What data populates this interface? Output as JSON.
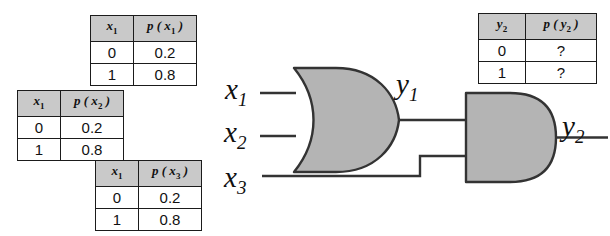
{
  "diagram": {
    "colors": {
      "gate_fill": "#b4b4b4",
      "gate_stroke": "#333333",
      "wire": "#333333",
      "table_header_bg": "#c9c9c9",
      "table_border": "#1b1b1b",
      "text": "#111111"
    }
  },
  "tables": [
    {
      "id": "table-x1",
      "headers": {
        "var": "x",
        "var_sub": "1",
        "prob": "p ( x",
        "prob_sub": "1",
        "prob_close": " )"
      },
      "rows": [
        {
          "value": "0",
          "prob": "0.2"
        },
        {
          "value": "1",
          "prob": "0.8"
        }
      ]
    },
    {
      "id": "table-x2",
      "headers": {
        "var": "x",
        "var_sub": "1",
        "prob": "p ( x",
        "prob_sub": "2",
        "prob_close": " )"
      },
      "rows": [
        {
          "value": "0",
          "prob": "0.2"
        },
        {
          "value": "1",
          "prob": "0.8"
        }
      ]
    },
    {
      "id": "table-x3",
      "headers": {
        "var": "x",
        "var_sub": "1",
        "prob": "p ( x",
        "prob_sub": "3",
        "prob_close": " )"
      },
      "rows": [
        {
          "value": "0",
          "prob": "0.2"
        },
        {
          "value": "1",
          "prob": "0.8"
        }
      ]
    },
    {
      "id": "table-y2",
      "headers": {
        "var": "y",
        "var_sub": "2",
        "prob": "p ( y",
        "prob_sub": "2",
        "prob_close": " )"
      },
      "rows": [
        {
          "value": "0",
          "prob": "?"
        },
        {
          "value": "1",
          "prob": "?"
        }
      ]
    }
  ],
  "signals": {
    "x1": {
      "base": "x",
      "sub": "1"
    },
    "x2": {
      "base": "x",
      "sub": "2"
    },
    "x3": {
      "base": "x",
      "sub": "3"
    },
    "y1": {
      "base": "y",
      "sub": "1"
    },
    "y2": {
      "base": "y",
      "sub": "2"
    }
  },
  "gates": [
    {
      "id": "or-gate",
      "type": "OR",
      "inputs": [
        "x1",
        "x2"
      ],
      "output": "y1"
    },
    {
      "id": "and-gate",
      "type": "AND",
      "inputs": [
        "y1",
        "x3"
      ],
      "output": "y2"
    }
  ]
}
